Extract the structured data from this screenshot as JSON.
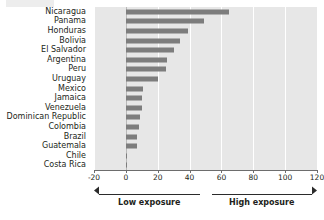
{
  "chart_data": {
    "type": "bar",
    "orientation": "horizontal",
    "title": "",
    "xlabel": "",
    "ylabel": "",
    "xlim": [
      -20,
      120
    ],
    "ticks": [
      -20,
      0,
      20,
      40,
      60,
      80,
      100,
      120
    ],
    "tick_labels": [
      "-20",
      "0",
      "20",
      "40",
      "60",
      "80",
      "100",
      "120"
    ],
    "grid": "vertical-white",
    "legend": "none",
    "bar_color": "#7d7d7d",
    "plot_background": "#e7e7e7",
    "categories": [
      "Nicaragua",
      "Panama",
      "Honduras",
      "Bolivia",
      "El Salvador",
      "Argentina",
      "Peru",
      "Uruguay",
      "Mexico",
      "Jamaica",
      "Venezuela",
      "Dominican Republic",
      "Colombia",
      "Brazil",
      "Guatemala",
      "Chile",
      "Costa Rica"
    ],
    "values": [
      65,
      49,
      39,
      34,
      30,
      26,
      25,
      20,
      11,
      10,
      10,
      9,
      8,
      7,
      7,
      1,
      0.5
    ],
    "annotations": {
      "low_exposure": "Low exposure",
      "high_exposure": "High exposure",
      "split_value": 50
    }
  }
}
